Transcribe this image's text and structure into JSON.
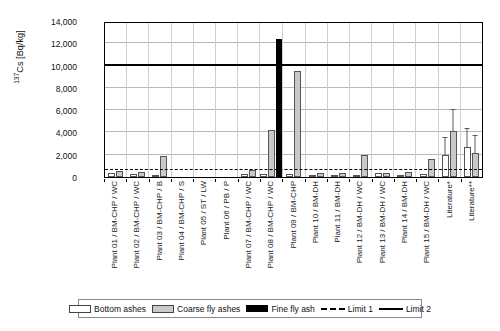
{
  "chart_data": {
    "type": "bar",
    "title": "",
    "xlabel": "",
    "ylabel": "137Cs [Bq/kg]",
    "ylim": [
      0,
      14000
    ],
    "ytick_labels": [
      "14,000",
      "12,000",
      "10,000",
      "8,000",
      "6,000",
      "4,000",
      "2,000",
      "0"
    ],
    "ytick_values": [
      14000,
      12000,
      10000,
      8000,
      6000,
      4000,
      2000,
      0
    ],
    "grid": true,
    "legend_position": "bottom",
    "categories": [
      "Plant 01 / BM-CHP / WC",
      "Plant 02 / BM-CHP / WC",
      "Plant 03 / BM-CHP / B",
      "Plant 04 / BM-CHP / S",
      "Plant 05 / ST / LW",
      "Plant 06 / PB / P",
      "Plant 07 / BM-CHP / WC",
      "Plant 08 / BM-CHP / WC",
      "Plant 09 / BM-CHP",
      "Plant 10 / BM-DH",
      "Plant 11 / BM-DH",
      "Plant 12 / BM-DH / WC",
      "Plant 13 / BM-DH / WC",
      "Plant 14 / BM-DH",
      "Plant 15 / BM-DH / WC",
      "Literature*",
      "Literature**"
    ],
    "series": [
      {
        "name": "Bottom ashes",
        "color": "#ffffff",
        "values": [
          330,
          280,
          200,
          0,
          0,
          0,
          230,
          300,
          260,
          180,
          210,
          190,
          330,
          200,
          240,
          2000,
          2700
        ],
        "errors": [
          0,
          0,
          0,
          0,
          0,
          0,
          0,
          0,
          0,
          0,
          0,
          0,
          0,
          0,
          0,
          1500,
          1650
        ]
      },
      {
        "name": "Coarse fly ashes",
        "color": "#c9c9c9",
        "values": [
          560,
          450,
          1900,
          0,
          0,
          0,
          620,
          4250,
          9500,
          400,
          350,
          2000,
          380,
          420,
          1600,
          4100,
          2200
        ],
        "errors": [
          0,
          0,
          0,
          0,
          0,
          0,
          0,
          0,
          0,
          0,
          0,
          0,
          0,
          0,
          0,
          1900,
          1450
        ]
      },
      {
        "name": "Fine fly ash",
        "color": "#000000",
        "values": [
          0,
          0,
          0,
          0,
          0,
          0,
          0,
          12350,
          0,
          0,
          0,
          0,
          0,
          0,
          0,
          0,
          0
        ],
        "errors": [
          0,
          0,
          0,
          0,
          0,
          0,
          0,
          0,
          0,
          0,
          0,
          0,
          0,
          0,
          0,
          0,
          0
        ]
      }
    ],
    "reference_lines": [
      {
        "name": "Limit 1",
        "value": 600,
        "style": "dashed"
      },
      {
        "name": "Limit 2",
        "value": 10000,
        "style": "solid"
      }
    ]
  },
  "legend": {
    "items": [
      {
        "label": "Bottom ashes",
        "swatch": "white"
      },
      {
        "label": "Coarse fly ashes",
        "swatch": "gray"
      },
      {
        "label": "Fine fly ash",
        "swatch": "black"
      },
      {
        "label": "Limit 1",
        "swatch": "dash"
      },
      {
        "label": "Limit 2",
        "swatch": "solid"
      }
    ]
  },
  "axis": {
    "y_title_main": "Cs [Bq/kg]",
    "y_title_sup": "137"
  }
}
